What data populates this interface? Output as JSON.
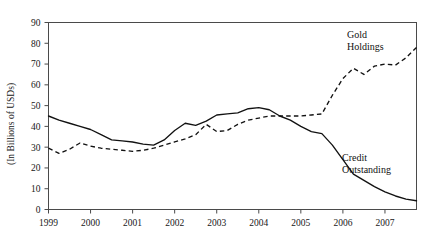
{
  "chart_data": {
    "type": "line",
    "title": "",
    "xlabel": "",
    "ylabel": "(In Billions of USDs)",
    "xlim": [
      1999,
      2007.75
    ],
    "ylim": [
      0,
      90
    ],
    "grid": false,
    "legend_position": "inline-annotations",
    "y_ticks": [
      0,
      10,
      20,
      30,
      40,
      50,
      60,
      70,
      80,
      90
    ],
    "y_tick_labels": [
      "0",
      "10",
      "20",
      "30",
      "40",
      "50",
      "60",
      "70",
      "80",
      "90"
    ],
    "x_ticks": [
      1999,
      2000,
      2001,
      2002,
      2003,
      2004,
      2005,
      2006,
      2007
    ],
    "x_tick_labels": [
      "1999",
      "2000",
      "2001",
      "2002",
      "2003",
      "2004",
      "2005",
      "2006",
      "2007"
    ],
    "series": [
      {
        "name": "Credit Outstanding",
        "style": "solid",
        "annotation_label_line1": "Credit",
        "annotation_label_line2": "Outstanding",
        "x": [
          1999.0,
          1999.25,
          1999.5,
          1999.75,
          2000.0,
          2000.25,
          2000.5,
          2000.75,
          2001.0,
          2001.25,
          2001.5,
          2001.75,
          2002.0,
          2002.25,
          2002.5,
          2002.75,
          2003.0,
          2003.25,
          2003.5,
          2003.75,
          2004.0,
          2004.25,
          2004.5,
          2004.75,
          2005.0,
          2005.25,
          2005.5,
          2005.75,
          2006.0,
          2006.25,
          2006.5,
          2006.75,
          2007.0,
          2007.25,
          2007.5,
          2007.75
        ],
        "y": [
          45.0,
          43.0,
          41.5,
          40.0,
          38.5,
          36.0,
          33.5,
          33.0,
          32.5,
          31.5,
          31.0,
          33.5,
          38.0,
          41.5,
          40.5,
          42.5,
          45.5,
          46.0,
          46.5,
          48.5,
          49.0,
          48.0,
          45.0,
          43.0,
          40.0,
          37.5,
          36.5,
          31.0,
          24.0,
          17.0,
          14.0,
          11.0,
          8.5,
          6.5,
          5.0,
          4.2
        ]
      },
      {
        "name": "Gold Holdings",
        "style": "dashed",
        "annotation_label_line1": "Gold",
        "annotation_label_line2": "Holdings",
        "x": [
          1999.0,
          1999.25,
          1999.5,
          1999.75,
          2000.0,
          2000.25,
          2000.5,
          2000.75,
          2001.0,
          2001.25,
          2001.5,
          2001.75,
          2002.0,
          2002.25,
          2002.5,
          2002.75,
          2003.0,
          2003.25,
          2003.5,
          2003.75,
          2004.0,
          2004.25,
          2004.5,
          2004.75,
          2005.0,
          2005.25,
          2005.5,
          2005.75,
          2006.0,
          2006.25,
          2006.5,
          2006.75,
          2007.0,
          2007.25,
          2007.5,
          2007.75
        ],
        "y": [
          29.5,
          27.0,
          29.0,
          32.0,
          30.5,
          29.5,
          29.0,
          28.5,
          28.0,
          28.5,
          29.5,
          31.0,
          32.5,
          34.0,
          36.0,
          41.0,
          37.5,
          38.0,
          41.0,
          43.0,
          44.0,
          45.0,
          45.0,
          45.0,
          45.0,
          45.5,
          46.0,
          55.0,
          63.0,
          68.0,
          65.0,
          69.0,
          70.0,
          69.5,
          73.0,
          78.0
        ]
      }
    ]
  }
}
